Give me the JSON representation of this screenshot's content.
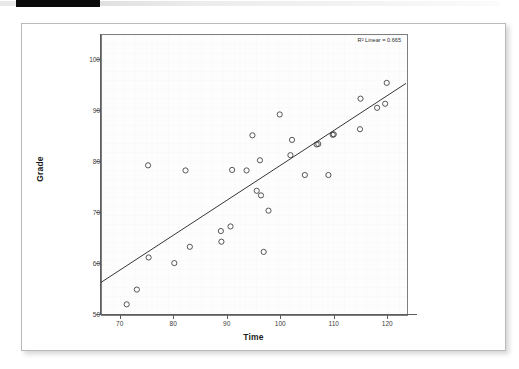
{
  "window": {
    "topbar_present": true,
    "black_bar_color": "#0a0a0a",
    "gray_bar_color": "#ececec"
  },
  "card": {
    "background": "#ffffff",
    "border_color": "#b9b9b9"
  },
  "chart_data": {
    "type": "scatter",
    "title": "",
    "subtitle": "",
    "xlabel": "Time",
    "ylabel": "Grade",
    "xlim": [
      66.5,
      123.5
    ],
    "ylim": [
      50,
      105
    ],
    "xticks": [
      70,
      80,
      90,
      100,
      110,
      120
    ],
    "yticks": [
      50,
      60,
      70,
      80,
      90,
      100
    ],
    "xtick_labels": [
      "70",
      "80",
      "90",
      "100",
      "110",
      "120"
    ],
    "ytick_labels": [
      "50",
      "60",
      "70",
      "80",
      "90",
      "100"
    ],
    "grid": false,
    "legend": "none",
    "marker": {
      "shape": "open-circle",
      "radius": 2.6,
      "stroke": "#3a3a3a",
      "fill": "none"
    },
    "annotations": [
      {
        "text": "R² Linear = 0.665",
        "position": "top-right",
        "r2": 0.665
      }
    ],
    "fit_line": {
      "type": "linear",
      "r_squared": 0.665,
      "color": "#1f1f1f",
      "x_start": 66.5,
      "y_start": 56.2,
      "x_end": 123.5,
      "y_end": 95.3
    },
    "points": [
      {
        "x": 71.3,
        "y": 51.9
      },
      {
        "x": 73.2,
        "y": 54.8
      },
      {
        "x": 75.4,
        "y": 61.1
      },
      {
        "x": 75.3,
        "y": 79.2
      },
      {
        "x": 80.2,
        "y": 60.0
      },
      {
        "x": 82.3,
        "y": 78.2
      },
      {
        "x": 83.1,
        "y": 63.2
      },
      {
        "x": 88.9,
        "y": 66.3
      },
      {
        "x": 89.0,
        "y": 64.2
      },
      {
        "x": 90.7,
        "y": 67.2
      },
      {
        "x": 91.0,
        "y": 78.3
      },
      {
        "x": 93.7,
        "y": 78.2
      },
      {
        "x": 94.8,
        "y": 85.1
      },
      {
        "x": 95.6,
        "y": 74.2
      },
      {
        "x": 96.2,
        "y": 80.2
      },
      {
        "x": 96.4,
        "y": 73.3
      },
      {
        "x": 96.9,
        "y": 62.2
      },
      {
        "x": 97.8,
        "y": 70.3
      },
      {
        "x": 99.9,
        "y": 89.2
      },
      {
        "x": 101.9,
        "y": 81.2
      },
      {
        "x": 102.2,
        "y": 84.2
      },
      {
        "x": 104.6,
        "y": 77.3
      },
      {
        "x": 106.8,
        "y": 83.3
      },
      {
        "x": 107.1,
        "y": 83.4
      },
      {
        "x": 109.0,
        "y": 77.3
      },
      {
        "x": 109.8,
        "y": 85.2
      },
      {
        "x": 110.0,
        "y": 85.3
      },
      {
        "x": 114.9,
        "y": 86.3
      },
      {
        "x": 115.0,
        "y": 92.3
      },
      {
        "x": 118.1,
        "y": 90.5
      },
      {
        "x": 119.6,
        "y": 91.3
      },
      {
        "x": 119.9,
        "y": 95.4
      }
    ]
  }
}
